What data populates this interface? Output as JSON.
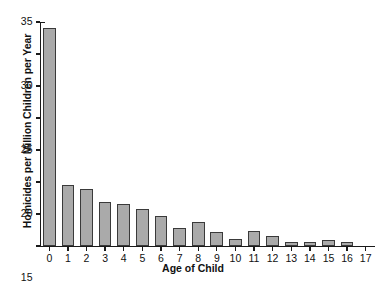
{
  "chart_data": {
    "type": "bar",
    "title": "",
    "xlabel": "Age of Child",
    "ylabel": "Homicides per Million Children per Year",
    "categories": [
      "0",
      "1",
      "2",
      "3",
      "4",
      "5",
      "6",
      "7",
      "8",
      "9",
      "10",
      "11",
      "12",
      "13",
      "14",
      "15",
      "16",
      "17"
    ],
    "values": [
      34.0,
      9.6,
      8.9,
      6.8,
      6.6,
      5.8,
      4.7,
      2.8,
      3.8,
      2.2,
      1.1,
      2.4,
      1.6,
      0.7,
      0.7,
      1.0,
      0.7,
      0.05
    ],
    "ylim": [
      0,
      35
    ],
    "yticks": [
      0,
      5,
      10,
      15,
      20,
      25,
      30,
      35
    ],
    "ytick_labels": [
      "0",
      "5",
      "10",
      "15",
      "20",
      "25",
      "30",
      "35"
    ],
    "xlim": [
      -0.5,
      17.5
    ],
    "grid": false,
    "legend": null,
    "bar_fill_color": "#aaaaaa",
    "bar_edge_color": "#3a3a3a",
    "axis_color": "#1a1a1a",
    "background_color": "#ffffff"
  }
}
